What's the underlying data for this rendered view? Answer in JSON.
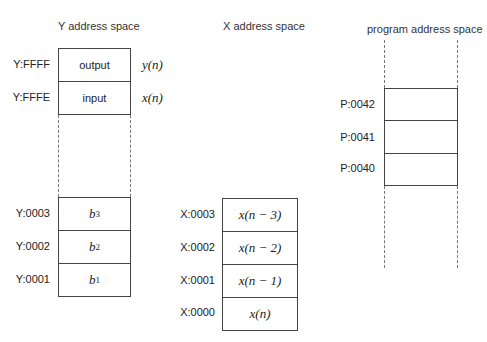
{
  "columns": {
    "y": {
      "title": "Y address space",
      "rows": [
        {
          "address": "Y:FFFF",
          "content": "output",
          "annotation": "y(n)"
        },
        {
          "address": "Y:FFFE",
          "content": "input",
          "annotation": "x(n)"
        },
        {
          "address": "Y:0003",
          "content": "b",
          "sub": "3"
        },
        {
          "address": "Y:0002",
          "content": "b",
          "sub": "2"
        },
        {
          "address": "Y:0001",
          "content": "b",
          "sub": "1"
        }
      ]
    },
    "x": {
      "title": "X address space",
      "rows": [
        {
          "address": "X:0003",
          "content": "x(n − 3)"
        },
        {
          "address": "X:0002",
          "content": "x(n − 2)"
        },
        {
          "address": "X:0001",
          "content": "x(n − 1)"
        },
        {
          "address": "X:0000",
          "content": "x(n)"
        }
      ]
    },
    "p": {
      "title": "program address space",
      "rows": [
        {
          "address": "P:0042",
          "content": ""
        },
        {
          "address": "P:0041",
          "content": ""
        },
        {
          "address": "P:0040",
          "content": ""
        }
      ]
    }
  }
}
